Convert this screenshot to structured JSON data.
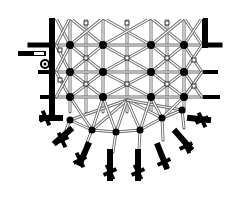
{
  "diagram": {
    "type": "architectural-floor-plan",
    "colors": {
      "background": "#ffffff",
      "ink": "#000000",
      "rib": "#6b6b6b",
      "rib_fill": "#ffffff"
    },
    "columns_x": [
      52,
      70,
      103,
      151,
      184,
      205
    ],
    "rows_y": [
      18,
      45,
      72,
      97,
      120
    ],
    "main_piers": [
      [
        70,
        45
      ],
      [
        103,
        45
      ],
      [
        151,
        45
      ],
      [
        184,
        45
      ],
      [
        70,
        72
      ],
      [
        103,
        72
      ],
      [
        151,
        72
      ],
      [
        184,
        72
      ],
      [
        70,
        97
      ],
      [
        103,
        97
      ],
      [
        151,
        97
      ],
      [
        184,
        97
      ]
    ],
    "apse_piers": [
      [
        70,
        120
      ],
      [
        92,
        130
      ],
      [
        116,
        132
      ],
      [
        140,
        130
      ],
      [
        162,
        118
      ],
      [
        182,
        110
      ]
    ],
    "minor_keys": [
      [
        86,
        23
      ],
      [
        127,
        23
      ],
      [
        167,
        23
      ],
      [
        86,
        58
      ],
      [
        127,
        58
      ],
      [
        167,
        58
      ],
      [
        86,
        84
      ],
      [
        127,
        84
      ],
      [
        167,
        84
      ],
      [
        60,
        50
      ],
      [
        60,
        80
      ],
      [
        194,
        60
      ],
      [
        194,
        86
      ]
    ],
    "buttresses": [
      {
        "x1": 52,
        "y1": 45,
        "x2": 30,
        "y2": 45,
        "w": 5
      },
      {
        "x1": 52,
        "y1": 72,
        "x2": 40,
        "y2": 72,
        "w": 4
      },
      {
        "x1": 52,
        "y1": 97,
        "x2": 42,
        "y2": 97,
        "w": 4
      },
      {
        "x1": 60,
        "y1": 118,
        "x2": 42,
        "y2": 118,
        "w": 6
      },
      {
        "x1": 70,
        "y1": 130,
        "x2": 56,
        "y2": 142,
        "w": 6
      },
      {
        "x1": 88,
        "y1": 145,
        "x2": 80,
        "y2": 163,
        "w": 6
      },
      {
        "x1": 110,
        "y1": 152,
        "x2": 110,
        "y2": 178,
        "w": 6
      },
      {
        "x1": 138,
        "y1": 152,
        "x2": 138,
        "y2": 178,
        "w": 6
      },
      {
        "x1": 158,
        "y1": 146,
        "x2": 166,
        "y2": 166,
        "w": 6
      },
      {
        "x1": 176,
        "y1": 132,
        "x2": 190,
        "y2": 148,
        "w": 6
      },
      {
        "x1": 190,
        "y1": 118,
        "x2": 208,
        "y2": 120,
        "w": 6
      },
      {
        "x1": 205,
        "y1": 97,
        "x2": 218,
        "y2": 97,
        "w": 4
      },
      {
        "x1": 205,
        "y1": 72,
        "x2": 216,
        "y2": 72,
        "w": 4
      },
      {
        "x1": 205,
        "y1": 45,
        "x2": 220,
        "y2": 45,
        "w": 5
      }
    ],
    "crosses": [
      [
        46,
        118
      ],
      [
        62,
        140
      ],
      [
        80,
        160
      ],
      [
        110,
        172
      ],
      [
        138,
        172
      ],
      [
        164,
        162
      ],
      [
        186,
        146
      ],
      [
        202,
        120
      ]
    ],
    "stair_turret": {
      "cx": 45,
      "cy": 64,
      "r": 4
    },
    "annex": {
      "x": 18,
      "y": 51,
      "w": 28,
      "h": 5
    }
  }
}
